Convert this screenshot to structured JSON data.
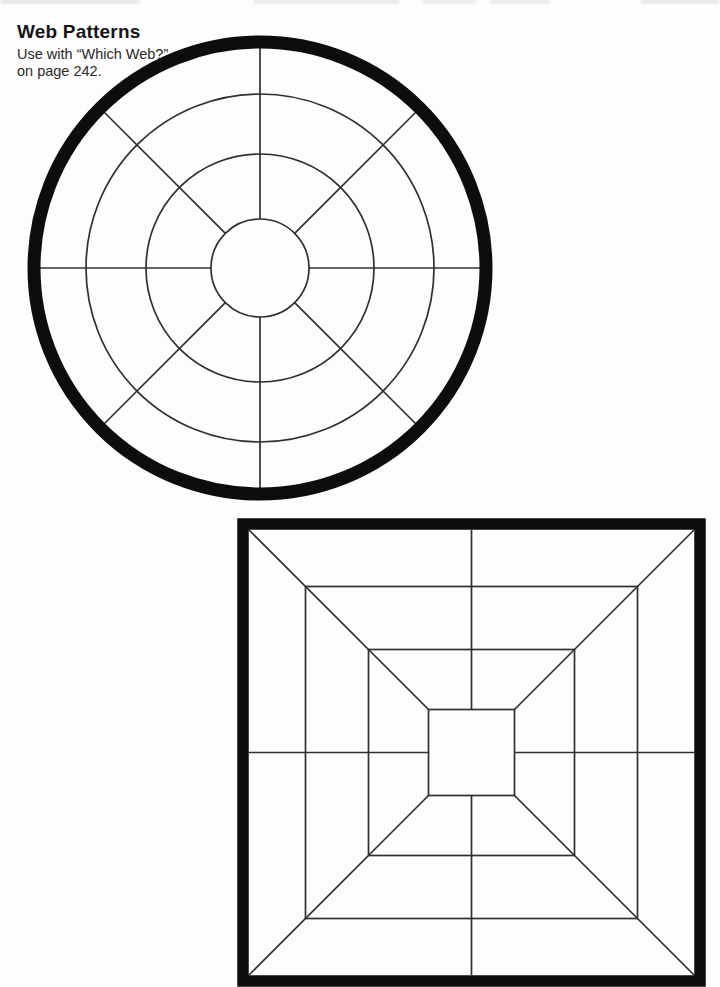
{
  "header": {
    "title": "Web Patterns",
    "subtitle_line1": "Use with “Which Web?”",
    "subtitle_line2": "on page 242."
  },
  "colors": {
    "page_background": "#fdfdfd",
    "heavy_line": "#0d0d0d",
    "thin_line": "#303030",
    "smudge": "#c9c9c9"
  },
  "circle_web": {
    "cx": 260,
    "cy": 268,
    "outer_ring_radius": 226,
    "outer_ring_stroke": 13,
    "inner_ring_radii": [
      174,
      114,
      49
    ],
    "spoke_count": 8,
    "spoke_start_angle_deg": 0,
    "spoke_inner_radius": 49,
    "spoke_outer_radius": 221,
    "thin_stroke": 1.7
  },
  "square_web": {
    "cx": 471.5,
    "cy": 752.5,
    "outer_half": 228.5,
    "outer_stroke": 11.5,
    "inner_square_halves": [
      166,
      103
    ],
    "center_square_half": 43,
    "diagonal_outer_half": 222.5,
    "cross_outer_half": 222.5,
    "thin_stroke": 1.7
  },
  "scan_artifacts": {
    "top_smudges": [
      {
        "x": 0,
        "width": 140,
        "opacity": 0.55
      },
      {
        "x": 253,
        "width": 147,
        "opacity": 0.45
      },
      {
        "x": 422,
        "width": 55,
        "opacity": 0.4
      },
      {
        "x": 490,
        "width": 60,
        "opacity": 0.4
      },
      {
        "x": 641,
        "width": 79,
        "opacity": 0.5
      }
    ]
  }
}
